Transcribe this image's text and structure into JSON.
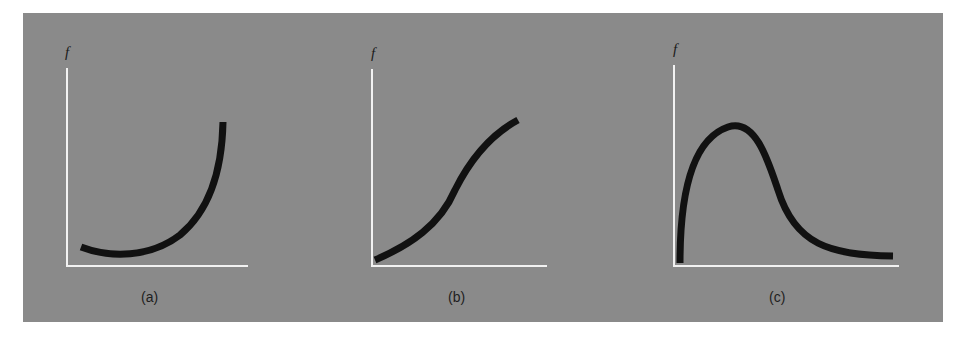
{
  "figure": {
    "panel_color": "#8a8a8a",
    "axis_color": "#f2f2f2",
    "curve_color": "#111111",
    "subplots": [
      {
        "id": "a",
        "y_axis_label": "f",
        "caption": "(a)",
        "shape": "convex increasing (U-shaped, rising steeply)"
      },
      {
        "id": "b",
        "y_axis_label": "f",
        "caption": "(b)",
        "shape": "sigmoid increasing"
      },
      {
        "id": "c",
        "y_axis_label": "f",
        "caption": "(c)",
        "shape": "skewed peak with long right tail"
      }
    ]
  }
}
